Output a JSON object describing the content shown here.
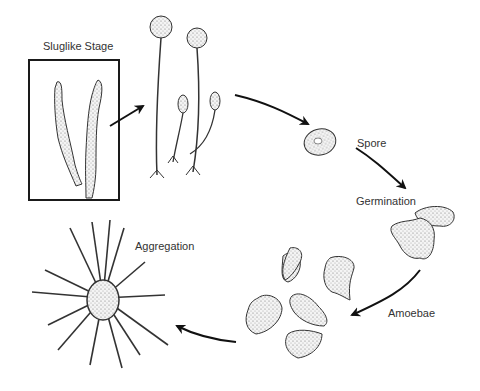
{
  "diagram": {
    "labels": {
      "slug": "Sluglike Stage",
      "spore": "Spore",
      "germination": "Germination",
      "amoebae": "Amoebae",
      "aggregation": "Aggregation"
    },
    "stages": [
      {
        "id": "sluglike-stage",
        "label": "Sluglike Stage"
      },
      {
        "id": "fruiting-bodies",
        "label": ""
      },
      {
        "id": "spore",
        "label": "Spore"
      },
      {
        "id": "germination",
        "label": "Germination"
      },
      {
        "id": "amoebae",
        "label": "Amoebae"
      },
      {
        "id": "aggregation",
        "label": "Aggregation"
      }
    ],
    "colors": {
      "ink": "#222222",
      "background": "#ffffff",
      "box": "#1a1a1a"
    }
  }
}
